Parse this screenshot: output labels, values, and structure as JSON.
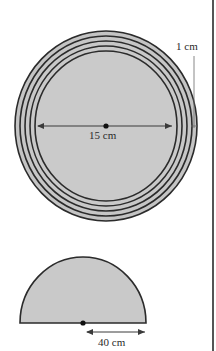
{
  "figure": {
    "colors": {
      "fill": "#c9c9c9",
      "stroke": "#2b2b2b",
      "arrow": "#3a3a3a",
      "border": "#555555",
      "background": "#ffffff"
    },
    "disc": {
      "ring_count": 5,
      "ring_width_label": "1 cm",
      "diameter_label": "15 cm"
    },
    "semicircle": {
      "radius_label": "40 cm"
    }
  }
}
